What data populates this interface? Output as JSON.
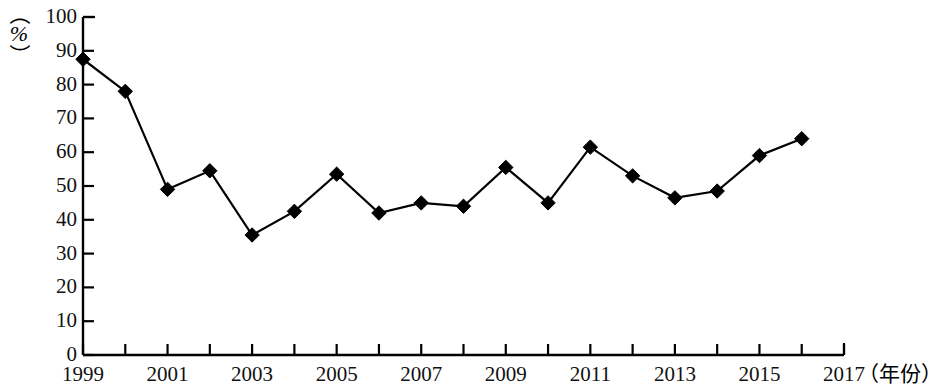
{
  "chart_data": {
    "type": "line",
    "title": "",
    "xlabel": "（年份）",
    "ylabel": "（%）",
    "x": [
      1999,
      2000,
      2001,
      2002,
      2003,
      2004,
      2005,
      2006,
      2007,
      2008,
      2009,
      2010,
      2011,
      2012,
      2013,
      2014,
      2015,
      2016
    ],
    "values": [
      87.5,
      78,
      49,
      54.5,
      35.5,
      42.5,
      53.5,
      42,
      45,
      44,
      55.5,
      45,
      61.5,
      53,
      46.5,
      48.5,
      59,
      64
    ],
    "xlim": [
      1999,
      2017
    ],
    "ylim": [
      0,
      100
    ],
    "x_tick_step": 1,
    "x_label_step": 2,
    "y_tick_step": 10,
    "x_tick_labels": [
      "1999",
      "",
      "2001",
      "",
      "2003",
      "",
      "2005",
      "",
      "2007",
      "",
      "2009",
      "",
      "2011",
      "",
      "2013",
      "",
      "2015",
      "",
      "2017"
    ],
    "y_tick_labels": [
      "0",
      "10",
      "20",
      "30",
      "40",
      "50",
      "60",
      "70",
      "80",
      "90",
      "100"
    ],
    "grid": false,
    "legend": "none",
    "marker": "diamond",
    "series_color": "#000000",
    "axis_color": "#000000"
  },
  "axis": {
    "y_unit_open_paren": "（",
    "y_unit_symbol": "%",
    "y_unit_close_paren": "）",
    "x_unit": "（年份）"
  }
}
